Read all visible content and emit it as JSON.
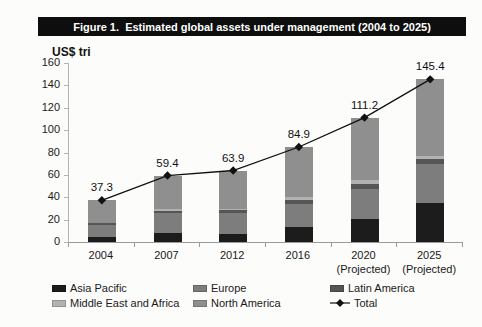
{
  "figure": {
    "title": "Figure 1.  Estimated global assets under management (2004 to 2025)"
  },
  "chart_data": {
    "type": "bar",
    "stacked": true,
    "title": "Figure 1.  Estimated global assets under management (2004 to 2025)",
    "unit_label": "US$ tri",
    "xlabel": "",
    "ylabel": "US$ tri",
    "categories": [
      "2004",
      "2007",
      "2012",
      "2016",
      "2020\n(Projected)",
      "2025\n(Projected)"
    ],
    "series": [
      {
        "name": "Asia Pacific",
        "color": "#1c1c1c",
        "values": [
          4.5,
          8,
          7,
          13,
          21,
          35
        ]
      },
      {
        "name": "Europe",
        "color": "#7d7d7d",
        "values": [
          11,
          18,
          19,
          21,
          26,
          35
        ]
      },
      {
        "name": "Latin America",
        "color": "#555555",
        "values": [
          1.2,
          2,
          2.5,
          3.5,
          4.5,
          4
        ]
      },
      {
        "name": "Middle East and Africa",
        "color": "#b2b2b2",
        "values": [
          0.6,
          1.4,
          1.4,
          2.4,
          4,
          3
        ]
      },
      {
        "name": "North America",
        "color": "#8f8f8f",
        "values": [
          20,
          30,
          34,
          45,
          55.7,
          68.4
        ]
      }
    ],
    "total_series": {
      "name": "Total",
      "color": "#111111",
      "marker": "diamond",
      "values": [
        37.3,
        59.4,
        63.9,
        84.9,
        111.2,
        145.4
      ],
      "labels": [
        "37.3",
        "59.4",
        "63.9",
        "84.9",
        "111.2",
        "145.4"
      ]
    },
    "ylim": [
      0,
      160
    ],
    "yticks": [
      0,
      20,
      40,
      60,
      80,
      100,
      120,
      140,
      160
    ],
    "grid": false,
    "legend_position": "bottom",
    "note": "Segment values are estimated from bar proportions; totals are the printed data labels."
  }
}
